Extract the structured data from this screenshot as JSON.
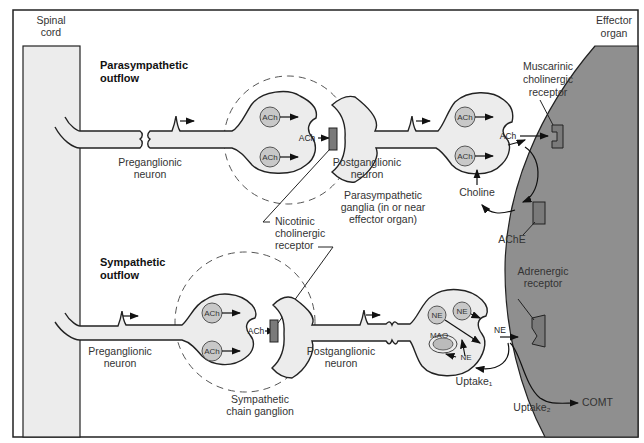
{
  "labels": {
    "spinal_cord": [
      "Spinal",
      "cord"
    ],
    "effector_organ": [
      "Effector",
      "organ"
    ],
    "parasympathetic_outflow": [
      "Parasympathetic",
      "outflow"
    ],
    "sympathetic_outflow": [
      "Sympathetic",
      "outflow"
    ],
    "para_preganglionic": [
      "Preganglionic",
      "neuron"
    ],
    "para_postganglionic": [
      "Postganglionic",
      "neuron"
    ],
    "para_ganglia": [
      "Parasympathetic",
      "ganglia (in or near",
      "effector organ)"
    ],
    "nicotinic_receptor": [
      "Nicotinic",
      "cholinergic",
      "receptor"
    ],
    "muscarinic_receptor": [
      "Muscarinic",
      "cholinergic",
      "receptor"
    ],
    "choline": "Choline",
    "ache": "AChE",
    "symp_preganglionic": [
      "Preganglionic",
      "neuron"
    ],
    "symp_postganglionic": [
      "Postganglionic",
      "neuron"
    ],
    "symp_chain": [
      "Sympathetic",
      "chain ganglion"
    ],
    "adrenergic_receptor": [
      "Adrenergic",
      "receptor"
    ],
    "uptake1": "Uptake₁",
    "uptake2": "Uptake₂",
    "comt": "COMT",
    "mao": "MAO"
  },
  "neurotransmitters": {
    "ach": "ACh",
    "ne": "NE"
  }
}
